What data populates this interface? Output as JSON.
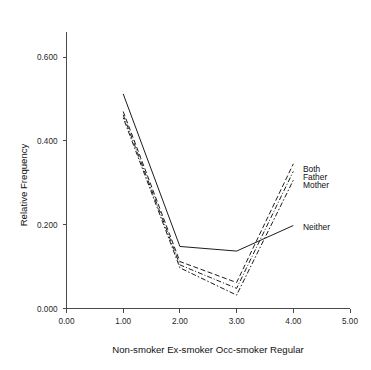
{
  "chart_data": {
    "type": "line",
    "title": "",
    "xlabel": "Non-smoker Ex-smoker Occ-smoker Regular",
    "ylabel": "Relative Frequency",
    "xlim": [
      0.0,
      5.0
    ],
    "ylim": [
      0.0,
      0.6
    ],
    "grid": false,
    "legend_position": "right-inline-labels",
    "x_ticks": [
      "0.00",
      "1.00",
      "2.00",
      "3.00",
      "4.00",
      "5.00"
    ],
    "x_tick_values": [
      0.0,
      1.0,
      2.0,
      3.0,
      4.0,
      5.0
    ],
    "y_ticks": [
      "0.000",
      "0.200",
      "0.400",
      "0.600"
    ],
    "y_tick_values": [
      0.0,
      0.2,
      0.4,
      0.6
    ],
    "x": [
      1.0,
      2.0,
      3.0,
      4.0
    ],
    "x_categories": [
      "Non-smoker",
      "Ex-smoker",
      "Occ-smoker",
      "Regular"
    ],
    "series": [
      {
        "name": "Neither",
        "style": "solid",
        "values": [
          0.512,
          0.148,
          0.137,
          0.198
        ],
        "label": "Neither",
        "label_x": 303,
        "label_y": 230
      },
      {
        "name": "Both",
        "style": "dashed",
        "values": [
          0.47,
          0.112,
          0.062,
          0.345
        ],
        "label": "Both",
        "label_x": 303,
        "label_y": 172
      },
      {
        "name": "Father",
        "style": "dashdot",
        "values": [
          0.462,
          0.104,
          0.048,
          0.327
        ],
        "label": "Father",
        "label_x": 303,
        "label_y": 180
      },
      {
        "name": "Mother",
        "style": "dotdash",
        "values": [
          0.455,
          0.097,
          0.032,
          0.306
        ],
        "label": "Mother",
        "label_x": 303,
        "label_y": 188
      }
    ]
  },
  "truncated_header": {
    "text": ""
  }
}
